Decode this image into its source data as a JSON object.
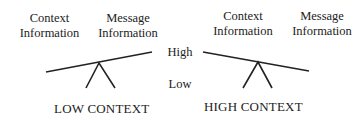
{
  "left": {
    "context_label": [
      "Context",
      "Information"
    ],
    "message_label": [
      "Message",
      "Information"
    ],
    "caption": "LOW CONTEXT"
  },
  "right": {
    "context_label": [
      "Context",
      "Information"
    ],
    "message_label": [
      "Message",
      "Information"
    ],
    "caption": "HIGH CONTEXT"
  },
  "scale": {
    "high": "High",
    "low": "Low"
  }
}
